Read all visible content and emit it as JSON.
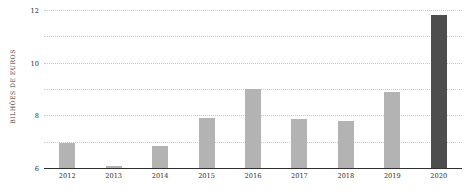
{
  "chart_data": {
    "type": "bar",
    "title": "",
    "xlabel": "",
    "ylabel": "BILHÕES DE EUROS",
    "categories": [
      "2012",
      "2013",
      "2014",
      "2015",
      "2016",
      "2017",
      "2018",
      "2019",
      "2020"
    ],
    "values": [
      1.9,
      0.15,
      1.7,
      3.8,
      6.0,
      3.7,
      3.55,
      5.75,
      11.65
    ],
    "ylim": [
      0,
      12
    ],
    "yticks": [
      0,
      2,
      4,
      6,
      8,
      10,
      12
    ],
    "ytick_labels": [
      "0",
      "2",
      "4",
      "6",
      "8",
      "10",
      "12"
    ],
    "grid": true,
    "legend": "none",
    "bar_color": "#b3b3b3",
    "highlight_color": "#4d4d4d",
    "highlight_index": 8,
    "axis_color": "#2f2f2f",
    "gridline_color": "#c9c9c9"
  }
}
